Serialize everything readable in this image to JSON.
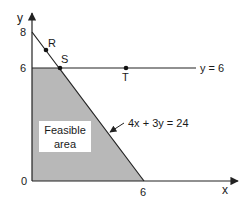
{
  "diagram": {
    "type": "linear-programming-graph",
    "axes": {
      "x_label": "x",
      "y_label": "y",
      "origin_label": "0"
    },
    "y_ticks": [
      "8",
      "6"
    ],
    "x_ticks": [
      "6"
    ],
    "points": [
      {
        "name": "R"
      },
      {
        "name": "S"
      },
      {
        "name": "T"
      }
    ],
    "lines": {
      "horizontal": "y = 6",
      "diagonal": "4x + 3y = 24"
    },
    "region": {
      "line1": "Feasible",
      "line2": "area"
    },
    "colors": {
      "region_fill": "#b8b8b8",
      "line": "#222222"
    }
  }
}
